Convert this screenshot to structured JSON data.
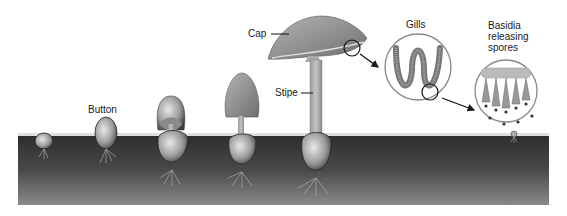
{
  "diagram": {
    "type": "biological-lifecycle-illustration",
    "color_mode": "grayscale",
    "colors": {
      "soil_dark": "#3a3a3a",
      "soil_mid": "#6a6a6a",
      "cap_gray": "#8a8a8a",
      "stipe_gray": "#a8a8a8",
      "outline": "#1a1a1a",
      "background": "#ffffff"
    },
    "labels": {
      "button": "Button",
      "cap": "Cap",
      "stipe": "Stipe",
      "gills": "Gills",
      "basidia": "Basidia releasing spores"
    },
    "stages": [
      {
        "name": "primordium",
        "label": ""
      },
      {
        "name": "button",
        "label": "Button"
      },
      {
        "name": "veil-breaking",
        "label": ""
      },
      {
        "name": "elongating",
        "label": ""
      },
      {
        "name": "mature-fruiting-body",
        "label": "Cap / Stipe"
      }
    ],
    "insets": [
      {
        "name": "gills-magnified",
        "label": "Gills"
      },
      {
        "name": "basidia-magnified",
        "label": "Basidia releasing spores"
      }
    ]
  }
}
